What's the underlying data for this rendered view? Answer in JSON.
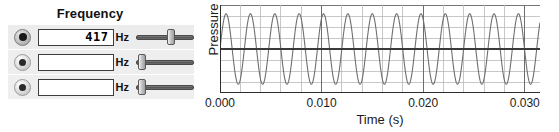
{
  "panel": {
    "title": "Frequency",
    "oscillators": [
      {
        "radio_name": "oscillator-1",
        "selected": true,
        "value": "417",
        "placeholder": "",
        "unit": "Hz",
        "slider_percent": 62
      },
      {
        "radio_name": "oscillator-2",
        "selected": false,
        "value": "",
        "placeholder": "",
        "unit": "Hz",
        "slider_percent": 3
      },
      {
        "radio_name": "oscillator-3",
        "selected": false,
        "value": "",
        "placeholder": "",
        "unit": "Hz",
        "slider_percent": 3
      }
    ]
  },
  "chart_data": {
    "type": "line",
    "title": "",
    "xlabel": "Time (s)",
    "ylabel": "Pressure",
    "xlim": [
      0.0,
      0.0315
    ],
    "ylim": [
      -1.25,
      1.25
    ],
    "xticks": [
      0.0,
      0.01,
      0.02,
      0.03
    ],
    "xtick_labels": [
      "0.000",
      "0.010",
      "0.020",
      "0.030"
    ],
    "yticks": [],
    "ytick_labels": [],
    "grid": true,
    "grid_minor_x_step": 0.002,
    "grid_major_x_step": 0.01,
    "grid_minor_y_divisions": 8,
    "grid_major_y_divisions": 2,
    "legend": null,
    "series": [
      {
        "name": "Pressure waveform",
        "waveform": "sine",
        "frequency_hz": 417,
        "amplitude": 1.0,
        "phase_deg": 0,
        "color": "#6f6f6f",
        "line_width": 1.1
      }
    ],
    "zero_line": {
      "value": 0,
      "color": "#3a3a3a",
      "line_width": 1.8
    },
    "axis_color": "#2e2e2e",
    "grid_minor_color": "#b9b9b9",
    "grid_major_color": "#6d6d6d"
  }
}
